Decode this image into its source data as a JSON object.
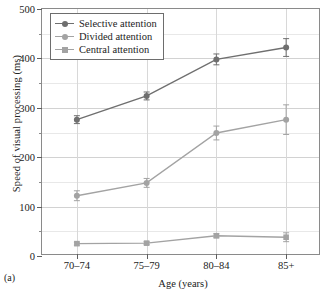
{
  "figure": {
    "panel_label": "(a)"
  },
  "chart_data": {
    "type": "line",
    "title": "",
    "xlabel": "Age (years)",
    "ylabel": "Speed of visual processing (ms)",
    "categories": [
      "70–74",
      "75–79",
      "80–84",
      "85+"
    ],
    "ylim": [
      0,
      500
    ],
    "yticks": [
      0,
      100,
      200,
      300,
      400,
      500
    ],
    "ytick_labels": [
      "0",
      "100",
      "200",
      "300",
      "400",
      "500"
    ],
    "yminor_ticks": [
      50,
      150,
      250,
      350,
      450
    ],
    "grid": true,
    "legend_position": "upper left",
    "series": [
      {
        "name": "Selective attention",
        "color": "#6f6f6f",
        "marker": "circle",
        "values": [
          276,
          324,
          398,
          422
        ],
        "errors": [
          8,
          8,
          11,
          18
        ]
      },
      {
        "name": "Divided attention",
        "color": "#a3a3a3",
        "marker": "circle",
        "values": [
          122,
          148,
          249,
          276
        ],
        "errors": [
          10,
          9,
          14,
          30
        ]
      },
      {
        "name": "Central attention",
        "color": "#a3a3a3",
        "marker": "square",
        "values": [
          25,
          26,
          41,
          38
        ],
        "errors": [
          3,
          3,
          4,
          9
        ]
      }
    ]
  }
}
